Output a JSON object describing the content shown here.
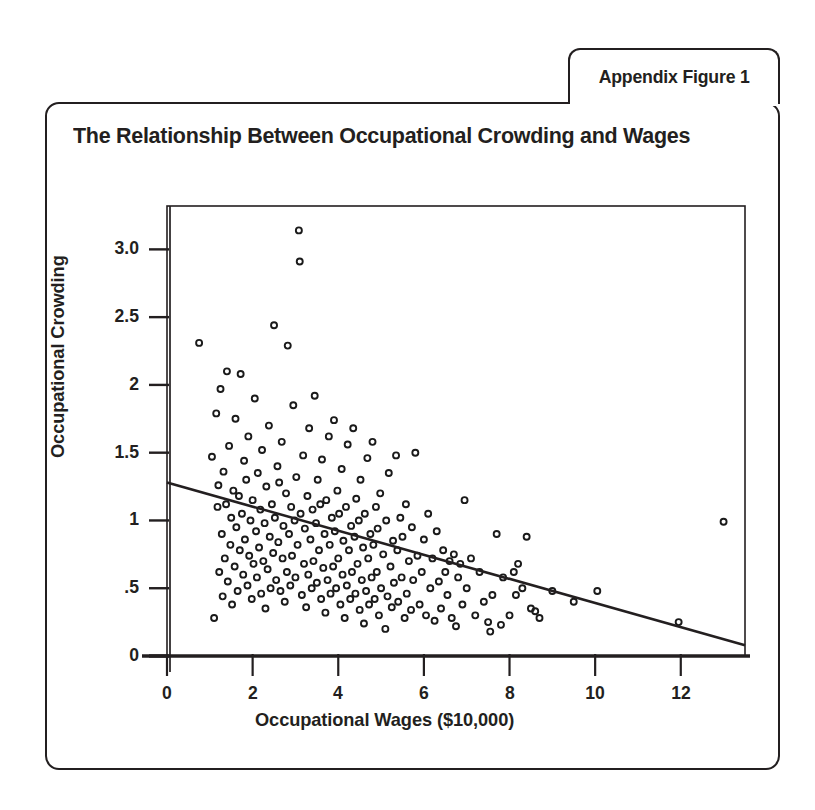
{
  "tab": {
    "label": "Appendix Figure 1"
  },
  "title": "The Relationship Between Occupational Crowding and Wages",
  "colors": {
    "ink": "#231f20",
    "background": "#ffffff",
    "marker": "#1a1a1a"
  },
  "chart_data": {
    "type": "scatter",
    "title": "The Relationship Between Occupational Crowding and Wages",
    "xlabel": "Occupational Wages ($10,000)",
    "ylabel": "Occupational Crowding",
    "xlim": [
      0,
      13.5
    ],
    "ylim": [
      0,
      3.32
    ],
    "xticks": [
      0,
      2,
      4,
      6,
      8,
      10,
      12
    ],
    "xticklabels": [
      "0",
      "2",
      "4",
      "6",
      "8",
      "10",
      "12"
    ],
    "yticks": [
      0,
      0.5,
      1,
      1.5,
      2,
      2.5,
      3.0
    ],
    "yticklabels": [
      "0",
      ".5",
      "1",
      "1.5",
      "2",
      "2.5",
      "3.0"
    ],
    "grid": false,
    "legend": null,
    "marker_style": "open-circle",
    "marker_size": 6,
    "fit_line": {
      "type": "linear",
      "label": "fitted regression line",
      "x": [
        0,
        13.5
      ],
      "y": [
        1.28,
        0.08
      ],
      "slope": -0.089,
      "intercept": 1.28
    },
    "points": [
      [
        0.75,
        2.31
      ],
      [
        1.05,
        1.47
      ],
      [
        1.1,
        0.28
      ],
      [
        1.15,
        1.79
      ],
      [
        1.18,
        1.1
      ],
      [
        1.2,
        1.26
      ],
      [
        1.22,
        0.62
      ],
      [
        1.25,
        1.97
      ],
      [
        1.28,
        0.9
      ],
      [
        1.3,
        0.44
      ],
      [
        1.32,
        1.36
      ],
      [
        1.35,
        0.72
      ],
      [
        1.38,
        1.12
      ],
      [
        1.4,
        2.1
      ],
      [
        1.42,
        0.55
      ],
      [
        1.45,
        1.55
      ],
      [
        1.48,
        0.82
      ],
      [
        1.5,
        1.02
      ],
      [
        1.52,
        0.38
      ],
      [
        1.55,
        1.22
      ],
      [
        1.58,
        0.66
      ],
      [
        1.6,
        1.75
      ],
      [
        1.62,
        0.95
      ],
      [
        1.65,
        0.48
      ],
      [
        1.68,
        1.18
      ],
      [
        1.7,
        0.78
      ],
      [
        1.72,
        2.08
      ],
      [
        1.75,
        1.05
      ],
      [
        1.78,
        0.6
      ],
      [
        1.8,
        1.44
      ],
      [
        1.82,
        0.86
      ],
      [
        1.85,
        1.3
      ],
      [
        1.88,
        0.52
      ],
      [
        1.9,
        1.62
      ],
      [
        1.92,
        0.74
      ],
      [
        1.95,
        1.0
      ],
      [
        1.98,
        0.42
      ],
      [
        2.0,
        1.15
      ],
      [
        2.02,
        0.68
      ],
      [
        2.05,
        1.9
      ],
      [
        2.08,
        0.92
      ],
      [
        2.1,
        0.58
      ],
      [
        2.12,
        1.35
      ],
      [
        2.15,
        0.8
      ],
      [
        2.18,
        1.08
      ],
      [
        2.2,
        0.46
      ],
      [
        2.22,
        1.52
      ],
      [
        2.25,
        0.7
      ],
      [
        2.28,
        0.98
      ],
      [
        2.3,
        0.35
      ],
      [
        2.32,
        1.25
      ],
      [
        2.35,
        0.64
      ],
      [
        2.38,
        1.7
      ],
      [
        2.4,
        0.88
      ],
      [
        2.42,
        0.5
      ],
      [
        2.45,
        1.12
      ],
      [
        2.48,
        0.76
      ],
      [
        2.5,
        2.44
      ],
      [
        2.52,
        1.02
      ],
      [
        2.55,
        0.56
      ],
      [
        2.58,
        1.4
      ],
      [
        2.6,
        0.84
      ],
      [
        2.62,
        1.28
      ],
      [
        2.65,
        0.48
      ],
      [
        2.68,
        1.58
      ],
      [
        2.7,
        0.72
      ],
      [
        2.72,
        0.96
      ],
      [
        2.75,
        0.4
      ],
      [
        2.78,
        1.2
      ],
      [
        2.8,
        0.62
      ],
      [
        2.82,
        2.29
      ],
      [
        2.85,
        0.9
      ],
      [
        2.88,
        0.52
      ],
      [
        2.9,
        1.1
      ],
      [
        2.92,
        0.74
      ],
      [
        2.95,
        1.85
      ],
      [
        2.98,
        1.0
      ],
      [
        3.0,
        0.58
      ],
      [
        3.02,
        1.32
      ],
      [
        3.05,
        0.82
      ],
      [
        3.08,
        3.14
      ],
      [
        3.1,
        2.91
      ],
      [
        3.12,
        1.05
      ],
      [
        3.15,
        0.45
      ],
      [
        3.18,
        1.48
      ],
      [
        3.2,
        0.68
      ],
      [
        3.22,
        0.94
      ],
      [
        3.25,
        0.36
      ],
      [
        3.28,
        1.18
      ],
      [
        3.3,
        0.6
      ],
      [
        3.32,
        1.68
      ],
      [
        3.35,
        0.86
      ],
      [
        3.38,
        0.5
      ],
      [
        3.4,
        1.08
      ],
      [
        3.42,
        0.7
      ],
      [
        3.45,
        1.92
      ],
      [
        3.48,
        0.98
      ],
      [
        3.5,
        0.54
      ],
      [
        3.52,
        1.3
      ],
      [
        3.55,
        0.78
      ],
      [
        3.58,
        1.12
      ],
      [
        3.6,
        0.42
      ],
      [
        3.62,
        1.45
      ],
      [
        3.65,
        0.65
      ],
      [
        3.68,
        0.9
      ],
      [
        3.7,
        0.32
      ],
      [
        3.72,
        1.15
      ],
      [
        3.75,
        0.56
      ],
      [
        3.78,
        1.62
      ],
      [
        3.8,
        0.82
      ],
      [
        3.82,
        0.46
      ],
      [
        3.85,
        1.02
      ],
      [
        3.88,
        0.66
      ],
      [
        3.9,
        1.74
      ],
      [
        3.92,
        0.92
      ],
      [
        3.95,
        0.5
      ],
      [
        3.98,
        1.22
      ],
      [
        4.0,
        0.72
      ],
      [
        4.02,
        1.05
      ],
      [
        4.05,
        0.38
      ],
      [
        4.08,
        1.38
      ],
      [
        4.1,
        0.6
      ],
      [
        4.12,
        0.85
      ],
      [
        4.15,
        0.28
      ],
      [
        4.18,
        1.1
      ],
      [
        4.2,
        0.52
      ],
      [
        4.22,
        1.56
      ],
      [
        4.25,
        0.78
      ],
      [
        4.28,
        0.42
      ],
      [
        4.3,
        0.96
      ],
      [
        4.32,
        0.62
      ],
      [
        4.35,
        1.68
      ],
      [
        4.38,
        0.88
      ],
      [
        4.4,
        0.46
      ],
      [
        4.42,
        1.16
      ],
      [
        4.45,
        0.68
      ],
      [
        4.48,
        1.0
      ],
      [
        4.5,
        0.34
      ],
      [
        4.52,
        1.3
      ],
      [
        4.55,
        0.56
      ],
      [
        4.58,
        0.8
      ],
      [
        4.6,
        0.24
      ],
      [
        4.62,
        1.05
      ],
      [
        4.65,
        0.48
      ],
      [
        4.68,
        1.46
      ],
      [
        4.7,
        0.72
      ],
      [
        4.72,
        0.38
      ],
      [
        4.75,
        0.9
      ],
      [
        4.78,
        0.58
      ],
      [
        4.8,
        1.58
      ],
      [
        4.82,
        0.82
      ],
      [
        4.85,
        0.42
      ],
      [
        4.88,
        1.1
      ],
      [
        4.9,
        0.62
      ],
      [
        4.92,
        0.94
      ],
      [
        4.95,
        0.3
      ],
      [
        4.98,
        1.2
      ],
      [
        5.0,
        0.5
      ],
      [
        5.05,
        0.75
      ],
      [
        5.1,
        0.2
      ],
      [
        5.12,
        1.0
      ],
      [
        5.15,
        0.44
      ],
      [
        5.18,
        1.35
      ],
      [
        5.22,
        0.66
      ],
      [
        5.25,
        0.36
      ],
      [
        5.28,
        0.85
      ],
      [
        5.3,
        0.54
      ],
      [
        5.35,
        1.48
      ],
      [
        5.38,
        0.78
      ],
      [
        5.4,
        0.4
      ],
      [
        5.45,
        1.02
      ],
      [
        5.48,
        0.58
      ],
      [
        5.5,
        0.88
      ],
      [
        5.55,
        0.28
      ],
      [
        5.58,
        1.12
      ],
      [
        5.6,
        0.46
      ],
      [
        5.65,
        0.7
      ],
      [
        5.7,
        0.34
      ],
      [
        5.72,
        0.95
      ],
      [
        5.75,
        0.56
      ],
      [
        5.8,
        1.5
      ],
      [
        5.85,
        0.74
      ],
      [
        5.9,
        0.38
      ],
      [
        5.95,
        0.62
      ],
      [
        6.0,
        0.86
      ],
      [
        6.05,
        0.3
      ],
      [
        6.1,
        1.05
      ],
      [
        6.15,
        0.5
      ],
      [
        6.2,
        0.72
      ],
      [
        6.25,
        0.26
      ],
      [
        6.3,
        0.92
      ],
      [
        6.35,
        0.55
      ],
      [
        6.4,
        0.35
      ],
      [
        6.45,
        0.78
      ],
      [
        6.5,
        0.62
      ],
      [
        6.55,
        0.45
      ],
      [
        6.6,
        0.7
      ],
      [
        6.65,
        0.28
      ],
      [
        6.7,
        0.75
      ],
      [
        6.75,
        0.22
      ],
      [
        6.8,
        0.58
      ],
      [
        6.85,
        0.68
      ],
      [
        6.9,
        0.38
      ],
      [
        6.95,
        1.15
      ],
      [
        7.0,
        0.5
      ],
      [
        7.1,
        0.72
      ],
      [
        7.2,
        0.3
      ],
      [
        7.3,
        0.62
      ],
      [
        7.4,
        0.4
      ],
      [
        7.5,
        0.25
      ],
      [
        7.55,
        0.18
      ],
      [
        7.6,
        0.45
      ],
      [
        7.7,
        0.9
      ],
      [
        7.8,
        0.23
      ],
      [
        7.85,
        0.58
      ],
      [
        8.0,
        0.3
      ],
      [
        8.1,
        0.62
      ],
      [
        8.15,
        0.45
      ],
      [
        8.2,
        0.68
      ],
      [
        8.3,
        0.5
      ],
      [
        8.4,
        0.88
      ],
      [
        8.5,
        0.35
      ],
      [
        8.6,
        0.33
      ],
      [
        8.7,
        0.28
      ],
      [
        9.0,
        0.48
      ],
      [
        9.5,
        0.4
      ],
      [
        10.05,
        0.48
      ],
      [
        11.95,
        0.25
      ],
      [
        13.0,
        0.99
      ]
    ]
  },
  "geometry": {
    "plot_left": 167,
    "plot_right": 745,
    "plot_top": 206,
    "plot_bottom": 656,
    "x_unit_px": 42.7,
    "y_unit_px": 131.3
  }
}
